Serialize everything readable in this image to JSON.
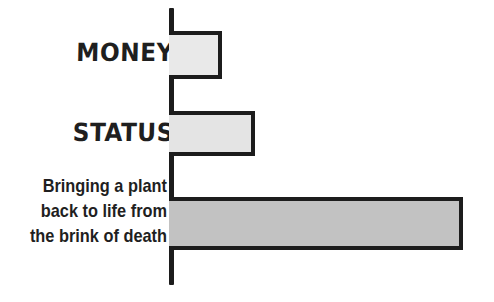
{
  "chart_data": {
    "type": "bar",
    "orientation": "horizontal",
    "title": "",
    "xlabel": "",
    "ylabel": "",
    "grid": false,
    "legend": null,
    "axis": {
      "show_y_axis_line": true,
      "show_x_axis_line": false,
      "x_tick_labels": [],
      "y_tick_labels": [
        "MONEY",
        "STATUS",
        "Bringing a plant back to life from the brink of death"
      ],
      "xlim": [
        0,
        330
      ]
    },
    "categories": [
      "MONEY",
      "STATUS",
      "Bringing a plant back to life from the brink of death"
    ],
    "values": [
      49,
      82,
      290
    ],
    "series": [
      {
        "name": "Amount of satisfaction",
        "values": [
          49,
          82,
          290
        ]
      }
    ]
  },
  "canvas": {
    "background_color": "#ffffff",
    "ink_color": "#1c1c1c"
  },
  "bars": [
    {
      "id": "bar-money",
      "category": "MONEY",
      "value": 49,
      "fill_color": "#e9e9e9",
      "stroke_color": "#1c1c1c",
      "x": 169,
      "y": 31,
      "width": 53,
      "height": 48
    },
    {
      "id": "bar-status",
      "category": "STATUS",
      "value": 82,
      "fill_color": "#e4e4e4",
      "stroke_color": "#1c1c1c",
      "x": 169,
      "y": 111,
      "width": 86,
      "height": 45
    },
    {
      "id": "bar-plant",
      "category": "Bringing a plant back to life from the brink of death",
      "value": 290,
      "fill_color": "#c2c2c2",
      "stroke_color": "#1c1c1c",
      "x": 169,
      "y": 197,
      "width": 294,
      "height": 53
    }
  ],
  "labels": {
    "money": "MONEY",
    "status": "STATUS",
    "plant": {
      "line1": "Bringing a plant",
      "line2": "back to life from",
      "line3": "the brink of death"
    }
  }
}
